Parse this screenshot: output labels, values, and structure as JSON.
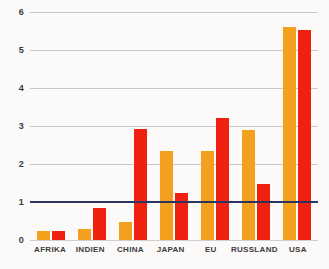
{
  "chart_data": {
    "type": "bar",
    "title": "",
    "subtitle": "",
    "xlabel": "",
    "ylabel": "",
    "ylim": [
      0,
      6
    ],
    "yticks": [
      0,
      1,
      2,
      3,
      4,
      5,
      6
    ],
    "ytick_labels": [
      "0",
      "1",
      "2",
      "3",
      "4",
      "5",
      "6"
    ],
    "grid": true,
    "legend_position": "none",
    "categories": [
      "AFRIKA",
      "INDIEN",
      "CHINA",
      "JAPAN",
      "EU",
      "RUSSLAND",
      "USA"
    ],
    "series": [
      {
        "name": "series-orange",
        "color": "#f2a01e",
        "values": [
          0.25,
          0.3,
          0.47,
          2.35,
          2.35,
          2.9,
          5.6
        ]
      },
      {
        "name": "series-red",
        "color": "#f02110",
        "values": [
          0.25,
          0.85,
          2.92,
          1.25,
          3.22,
          1.48,
          5.53
        ]
      }
    ],
    "annotations": [
      {
        "type": "reference-line",
        "axis": "y",
        "value": 1,
        "color": "#2c3361",
        "label": ""
      }
    ],
    "colors": {
      "background": "#fbfaf8",
      "gridline": "#c9c9cb",
      "reference_line": "#2c3361",
      "tick_text": "#3b3b3d"
    }
  }
}
